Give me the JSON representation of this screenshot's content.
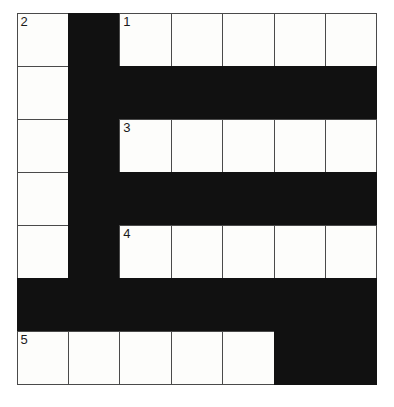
{
  "puzzle": {
    "type": "crossword-grid",
    "title": "",
    "rows": 7,
    "columns": 7,
    "cell_color_white": "#fdfdfb",
    "cell_color_black": "#111111",
    "border_color": "#4a4a4a",
    "background_color": "#ffffff",
    "grid": [
      [
        {
          "state": "white",
          "number": "2",
          "letter": ""
        },
        {
          "state": "black",
          "number": "",
          "letter": ""
        },
        {
          "state": "white",
          "number": "1",
          "letter": ""
        },
        {
          "state": "white",
          "number": "",
          "letter": ""
        },
        {
          "state": "white",
          "number": "",
          "letter": ""
        },
        {
          "state": "white",
          "number": "",
          "letter": ""
        },
        {
          "state": "white",
          "number": "",
          "letter": ""
        }
      ],
      [
        {
          "state": "white",
          "number": "",
          "letter": ""
        },
        {
          "state": "black",
          "number": "",
          "letter": ""
        },
        {
          "state": "black",
          "number": "",
          "letter": ""
        },
        {
          "state": "black",
          "number": "",
          "letter": ""
        },
        {
          "state": "black",
          "number": "",
          "letter": ""
        },
        {
          "state": "black",
          "number": "",
          "letter": ""
        },
        {
          "state": "black",
          "number": "",
          "letter": ""
        }
      ],
      [
        {
          "state": "white",
          "number": "",
          "letter": ""
        },
        {
          "state": "black",
          "number": "",
          "letter": ""
        },
        {
          "state": "white",
          "number": "3",
          "letter": ""
        },
        {
          "state": "white",
          "number": "",
          "letter": ""
        },
        {
          "state": "white",
          "number": "",
          "letter": ""
        },
        {
          "state": "white",
          "number": "",
          "letter": ""
        },
        {
          "state": "white",
          "number": "",
          "letter": ""
        }
      ],
      [
        {
          "state": "white",
          "number": "",
          "letter": ""
        },
        {
          "state": "black",
          "number": "",
          "letter": ""
        },
        {
          "state": "black",
          "number": "",
          "letter": ""
        },
        {
          "state": "black",
          "number": "",
          "letter": ""
        },
        {
          "state": "black",
          "number": "",
          "letter": ""
        },
        {
          "state": "black",
          "number": "",
          "letter": ""
        },
        {
          "state": "black",
          "number": "",
          "letter": ""
        }
      ],
      [
        {
          "state": "white",
          "number": "",
          "letter": ""
        },
        {
          "state": "black",
          "number": "",
          "letter": ""
        },
        {
          "state": "white",
          "number": "4",
          "letter": ""
        },
        {
          "state": "white",
          "number": "",
          "letter": ""
        },
        {
          "state": "white",
          "number": "",
          "letter": ""
        },
        {
          "state": "white",
          "number": "",
          "letter": ""
        },
        {
          "state": "white",
          "number": "",
          "letter": ""
        }
      ],
      [
        {
          "state": "black",
          "number": "",
          "letter": ""
        },
        {
          "state": "black",
          "number": "",
          "letter": ""
        },
        {
          "state": "black",
          "number": "",
          "letter": ""
        },
        {
          "state": "black",
          "number": "",
          "letter": ""
        },
        {
          "state": "black",
          "number": "",
          "letter": ""
        },
        {
          "state": "black",
          "number": "",
          "letter": ""
        },
        {
          "state": "black",
          "number": "",
          "letter": ""
        }
      ],
      [
        {
          "state": "white",
          "number": "5",
          "letter": ""
        },
        {
          "state": "white",
          "number": "",
          "letter": ""
        },
        {
          "state": "white",
          "number": "",
          "letter": ""
        },
        {
          "state": "white",
          "number": "",
          "letter": ""
        },
        {
          "state": "white",
          "number": "",
          "letter": ""
        },
        {
          "state": "black",
          "number": "",
          "letter": ""
        },
        {
          "state": "black",
          "number": "",
          "letter": ""
        }
      ]
    ],
    "clue_numbers": [
      "1",
      "2",
      "3",
      "4",
      "5"
    ]
  }
}
